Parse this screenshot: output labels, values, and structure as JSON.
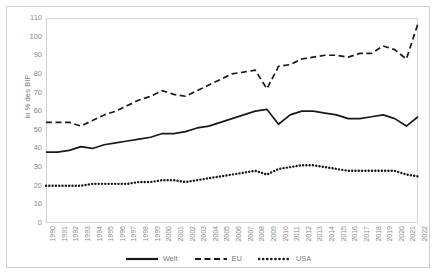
{
  "chart_data": {
    "type": "line",
    "title": "",
    "xlabel": "",
    "ylabel": "in % des BIP",
    "ylim": [
      0,
      110
    ],
    "ytick_step": 10,
    "yticks": [
      0,
      10,
      20,
      30,
      40,
      50,
      60,
      70,
      80,
      90,
      100,
      110
    ],
    "grid": false,
    "legend_position": "bottom",
    "categories": [
      "1990",
      "1991",
      "1992",
      "1993",
      "1994",
      "1995",
      "1996",
      "1997",
      "1998",
      "1999",
      "2000",
      "2001",
      "2002",
      "2003",
      "2004",
      "2005",
      "2006",
      "2007",
      "2008",
      "2009",
      "2010",
      "2011",
      "2012",
      "2013",
      "2014",
      "2015",
      "2016",
      "2017",
      "2018",
      "2019",
      "2020",
      "2021",
      "2022"
    ],
    "series": [
      {
        "name": "Welt",
        "style": "solid",
        "color": "#1a1a1a",
        "values": [
          38,
          38,
          39,
          41,
          40,
          42,
          43,
          44,
          45,
          46,
          48,
          48,
          49,
          51,
          52,
          54,
          56,
          58,
          60,
          61,
          53,
          58,
          60,
          60,
          59,
          58,
          56,
          56,
          57,
          58,
          56,
          52,
          57
        ]
      },
      {
        "name": "EU",
        "style": "dashed",
        "color": "#1a1a1a",
        "values": [
          54,
          54,
          54,
          52,
          55,
          58,
          60,
          63,
          66,
          68,
          71,
          69,
          68,
          71,
          74,
          77,
          80,
          81,
          82,
          72,
          84,
          85,
          88,
          89,
          90,
          90,
          89,
          91,
          91,
          95,
          93,
          88,
          107
        ]
      },
      {
        "name": "USA",
        "style": "dotted",
        "color": "#1a1a1a",
        "values": [
          20,
          20,
          20,
          20,
          21,
          21,
          21,
          21,
          22,
          22,
          23,
          23,
          22,
          23,
          24,
          25,
          26,
          27,
          28,
          26,
          29,
          30,
          31,
          31,
          30,
          29,
          28,
          28,
          28,
          28,
          28,
          26,
          25
        ]
      }
    ]
  },
  "legend": {
    "items": [
      {
        "label": "Welt",
        "style": "solid"
      },
      {
        "label": "EU",
        "style": "dashed"
      },
      {
        "label": "USA",
        "style": "dotted"
      }
    ]
  }
}
